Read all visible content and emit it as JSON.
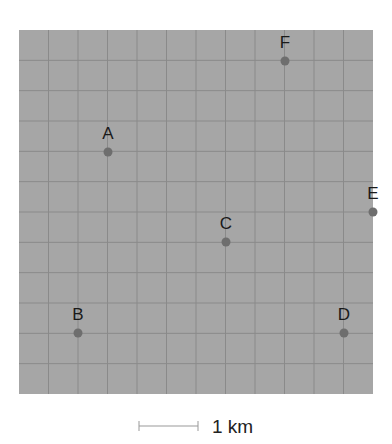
{
  "grid": {
    "left": 19,
    "top": 30,
    "right": 373,
    "bottom": 394,
    "cols": 12,
    "rows": 12,
    "fill": "#a6a6a6",
    "line_color": "#8a8a8a"
  },
  "points": [
    {
      "label": "A",
      "x": 108,
      "y": 152
    },
    {
      "label": "B",
      "x": 78,
      "y": 333
    },
    {
      "label": "C",
      "x": 226,
      "y": 242
    },
    {
      "label": "D",
      "x": 344,
      "y": 333
    },
    {
      "label": "E",
      "x": 373,
      "y": 212
    },
    {
      "label": "F",
      "x": 285,
      "y": 61
    }
  ],
  "point_color": "#6e6e6e",
  "scale": {
    "label": "1 km",
    "x1": 139,
    "x2": 198,
    "y": 426
  }
}
